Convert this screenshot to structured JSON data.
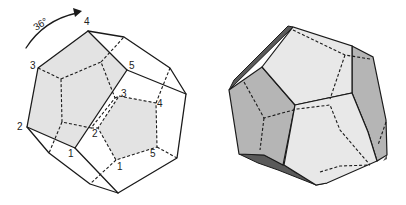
{
  "figure_left": {
    "description": "Wireframe dodecahedron showing two pentagonal faces rotated 36 degrees relative to each other",
    "rotation_label": "36°",
    "front_face_labels": [
      "1",
      "2",
      "3",
      "4",
      "5"
    ],
    "back_face_labels": [
      "1",
      "2",
      "3",
      "4",
      "5"
    ],
    "front_face_fill": "#e3e3e3",
    "back_face_fill": "#e3e3e3",
    "line_color": "#1a1a1a"
  },
  "figure_right": {
    "description": "Shaded dodecahedron with hidden edges dashed",
    "light_fill": "#e8e8e8",
    "mid_fill": "#b5b5b5",
    "dark_fill": "#5a5a5a",
    "line_color": "#1a1a1a"
  }
}
